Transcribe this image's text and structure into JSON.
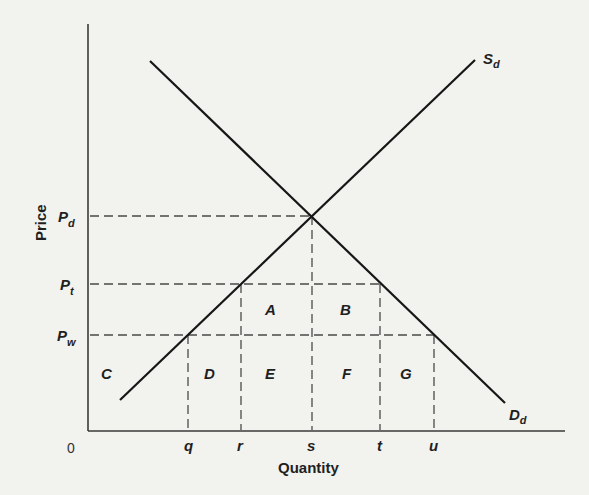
{
  "diagram": {
    "type": "supply-demand-tariff",
    "axes": {
      "y_label": "Price",
      "x_label": "Quantity",
      "origin_label": "0"
    },
    "curves": {
      "supply": {
        "label": "S",
        "subscript": "d"
      },
      "demand": {
        "label": "D",
        "subscript": "d"
      }
    },
    "price_levels": [
      {
        "id": "pd",
        "label": "P",
        "subscript": "d"
      },
      {
        "id": "pt",
        "label": "P",
        "subscript": "t"
      },
      {
        "id": "pw",
        "label": "P",
        "subscript": "w"
      }
    ],
    "quantity_ticks": [
      "q",
      "r",
      "s",
      "t",
      "u"
    ],
    "areas": [
      "A",
      "B",
      "C",
      "D",
      "E",
      "F",
      "G"
    ]
  },
  "colors": {
    "background": "#f2f2ef",
    "ink": "#1a1a1a",
    "dash": "#4a4a4a"
  }
}
